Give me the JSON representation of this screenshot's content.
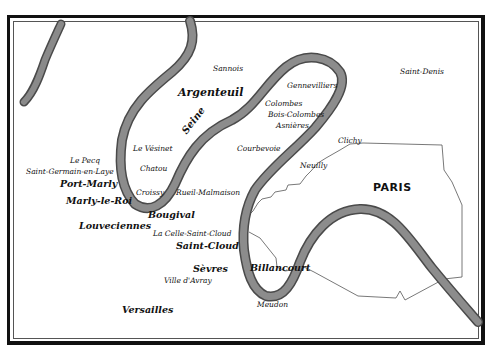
{
  "map": {
    "region_label": "PARIS",
    "river_name": "Seine",
    "colors": {
      "river": "#7a7a7a",
      "river_edge": "#4a4a4a",
      "boundary": "#555555",
      "frame": "#111111",
      "text": "#111111",
      "background": "#ffffff"
    },
    "places": [
      {
        "name": "Sannois",
        "x": 213,
        "y": 65,
        "size": "sm"
      },
      {
        "name": "Saint-Denis",
        "x": 400,
        "y": 68,
        "size": "sm"
      },
      {
        "name": "Argenteuil",
        "x": 178,
        "y": 88,
        "size": "lg"
      },
      {
        "name": "Gennevilliers",
        "x": 287,
        "y": 82,
        "size": "sm"
      },
      {
        "name": "Colombes",
        "x": 265,
        "y": 100,
        "size": "sm"
      },
      {
        "name": "Bois-Colombes",
        "x": 268,
        "y": 111,
        "size": "sm"
      },
      {
        "name": "Asnières",
        "x": 276,
        "y": 122,
        "size": "sm"
      },
      {
        "name": "Le Vésinet",
        "x": 133,
        "y": 145,
        "size": "sm"
      },
      {
        "name": "Courbevoie",
        "x": 237,
        "y": 145,
        "size": "sm"
      },
      {
        "name": "Clichy",
        "x": 338,
        "y": 137,
        "size": "sm"
      },
      {
        "name": "Le Pecq",
        "x": 70,
        "y": 157,
        "size": "sm"
      },
      {
        "name": "Chatou",
        "x": 140,
        "y": 165,
        "size": "sm"
      },
      {
        "name": "Neuilly",
        "x": 300,
        "y": 162,
        "size": "sm"
      },
      {
        "name": "Saint-Germain-en-Laye",
        "x": 27,
        "y": 168,
        "size": "sm"
      },
      {
        "name": "Port-Marly",
        "x": 60,
        "y": 180,
        "size": "md"
      },
      {
        "name": "PARIS",
        "x": 373,
        "y": 182,
        "size": "paris"
      },
      {
        "name": "Croissy",
        "x": 136,
        "y": 189,
        "size": "sm"
      },
      {
        "name": "Rueil-Malmaison",
        "x": 176,
        "y": 189,
        "size": "sm"
      },
      {
        "name": "Marly-le-Roi",
        "x": 66,
        "y": 197,
        "size": "md"
      },
      {
        "name": "Bougival",
        "x": 148,
        "y": 211,
        "size": "md"
      },
      {
        "name": "Louveciennes",
        "x": 79,
        "y": 222,
        "size": "md"
      },
      {
        "name": "La Celle-Saint-Cloud",
        "x": 153,
        "y": 230,
        "size": "sm"
      },
      {
        "name": "Saint-Cloud",
        "x": 176,
        "y": 242,
        "size": "md"
      },
      {
        "name": "Sèvres",
        "x": 193,
        "y": 264,
        "size": "md"
      },
      {
        "name": "Billancourt",
        "x": 250,
        "y": 264,
        "size": "md"
      },
      {
        "name": "Ville d'Avray",
        "x": 164,
        "y": 276,
        "size": "sm"
      },
      {
        "name": "Meudon",
        "x": 257,
        "y": 301,
        "size": "sm"
      },
      {
        "name": "Versailles",
        "x": 122,
        "y": 306,
        "size": "md"
      }
    ]
  }
}
